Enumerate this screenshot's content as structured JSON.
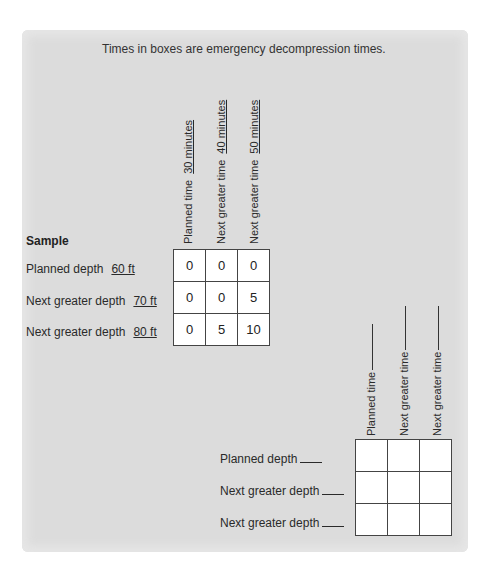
{
  "title": "Times in boxes are emergency decompression times.",
  "sample": {
    "heading": "Sample",
    "columns": [
      {
        "label": "Planned time",
        "value": "30 minutes"
      },
      {
        "label": "Next greater time",
        "value": "40 minutes"
      },
      {
        "label": "Next greater time",
        "value": "50 minutes"
      }
    ],
    "rows": [
      {
        "label": "Planned depth",
        "value": "60 ft",
        "cells": [
          "0",
          "0",
          "0"
        ]
      },
      {
        "label": "Next greater depth",
        "value": "70 ft",
        "cells": [
          "0",
          "0",
          "5"
        ]
      },
      {
        "label": "Next greater depth",
        "value": "80 ft",
        "cells": [
          "0",
          "5",
          "10"
        ]
      }
    ]
  },
  "worksheet": {
    "columns": [
      {
        "label": "Planned time"
      },
      {
        "label": "Next greater time"
      },
      {
        "label": "Next greater time"
      }
    ],
    "rows": [
      {
        "label": "Planned depth",
        "cells": [
          "",
          "",
          ""
        ]
      },
      {
        "label": "Next greater depth",
        "cells": [
          "",
          "",
          ""
        ]
      },
      {
        "label": "Next greater depth",
        "cells": [
          "",
          "",
          ""
        ]
      }
    ]
  }
}
